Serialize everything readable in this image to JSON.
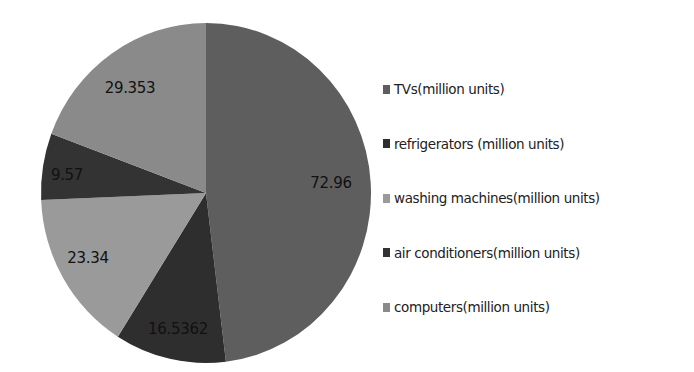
{
  "chart_data": {
    "type": "pie",
    "title": "",
    "start_angle_deg": 0,
    "direction": "clockwise",
    "categories": [
      "TVs(million units)",
      "refrigerators  (million units)",
      "washing machines(million units)",
      "air conditioners(million units)",
      "computers(million units)"
    ],
    "values": [
      72.96,
      16.5362,
      23.34,
      9.57,
      29.353
    ],
    "data_labels": [
      "72.96",
      "16.5362",
      "23.34",
      "9.57",
      "29.353"
    ],
    "colors": [
      "#5e5e5e",
      "#2e2e2e",
      "#9a9a9a",
      "#333333",
      "#8a8a8a"
    ],
    "legend_position": "right"
  },
  "labels": {
    "slice_0": "72.96",
    "slice_1": "16.5362",
    "slice_2": "23.34",
    "slice_3": "9.57",
    "slice_4": "29.353"
  },
  "legend": {
    "items": [
      {
        "label": "TVs(million units)",
        "color": "#5e5e5e"
      },
      {
        "label": "refrigerators  (million units)",
        "color": "#2e2e2e"
      },
      {
        "label": "washing machines(million units)",
        "color": "#9a9a9a"
      },
      {
        "label": "air conditioners(million units)",
        "color": "#333333"
      },
      {
        "label": "computers(million units)",
        "color": "#8a8a8a"
      }
    ]
  }
}
